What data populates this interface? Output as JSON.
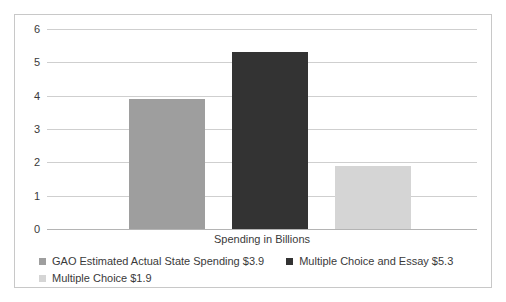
{
  "chart_data": {
    "type": "bar",
    "title": "",
    "subtitle": "",
    "xlabel": "Spending in Billions",
    "ylabel": "",
    "categories": [
      "GAO Estimated Actual State Spending",
      "Multiple Choice and Essay",
      "Multiple Choice"
    ],
    "values": [
      3.9,
      5.3,
      1.9
    ],
    "ylim": [
      0,
      6
    ],
    "yticks": [
      0,
      1,
      2,
      3,
      4,
      5,
      6
    ],
    "ytick_labels": [
      "0",
      "1",
      "2",
      "3",
      "4",
      "5",
      "6"
    ],
    "grid": true,
    "legend_position": "bottom",
    "colors": [
      "#9e9e9e",
      "#333333",
      "#d5d5d5"
    ],
    "series": [
      {
        "name": "GAO Estimated Actual State Spending $3.9",
        "value": 3.9,
        "color": "#9e9e9e"
      },
      {
        "name": "Multiple Choice and Essay $5.3",
        "value": 5.3,
        "color": "#333333"
      },
      {
        "name": "Multiple Choice $1.9",
        "value": 1.9,
        "color": "#d5d5d5"
      }
    ]
  },
  "axis": {
    "x_title": "Spending in Billions",
    "y_labels": {
      "t0": "0",
      "t1": "1",
      "t2": "2",
      "t3": "3",
      "t4": "4",
      "t5": "5",
      "t6": "6"
    }
  },
  "legend": {
    "items": [
      {
        "label": "GAO Estimated Actual State Spending $3.9",
        "color": "#9e9e9e"
      },
      {
        "label": "Multiple Choice and Essay $5.3",
        "color": "#333333"
      },
      {
        "label": "Multiple Choice $1.9",
        "color": "#d5d5d5"
      }
    ]
  },
  "style": {
    "border_color": "#c8c8c8",
    "gridline_color": "#cfcfcf",
    "axis_color": "#b4b4b4",
    "text_color": "#3a3a3a",
    "background": "#ffffff"
  }
}
